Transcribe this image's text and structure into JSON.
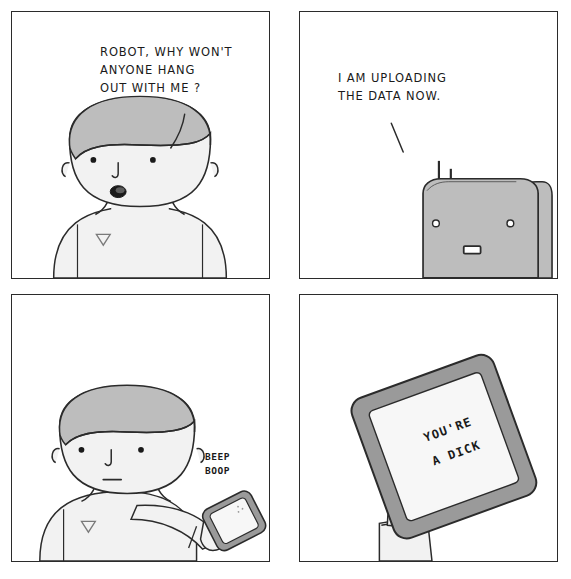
{
  "comic": {
    "title": "Robot Uploading The Data",
    "panel_count": 4,
    "colors": {
      "ink": "#2b2b2b",
      "skin_fill": "#f2f2f2",
      "hair_fill": "#bdbdbd",
      "robot_fill": "#bdbdbd",
      "tablet_bezel": "#9a9a9a",
      "tablet_screen": "#f7f7f7",
      "background": "#ffffff"
    },
    "panels": [
      {
        "id": "panel-1",
        "position": "top-left",
        "speaker": "man",
        "dialogue": "ROBOT, WHY WON'T\nANYONE HANG\nOUT WITH ME ?",
        "dialogue_lines": [
          "ROBOT, WHY WON'T",
          "ANYONE HANG",
          "OUT WITH ME ?"
        ],
        "scene": "man-talking-open-mouth",
        "characters": [
          "man"
        ],
        "expression": "open-mouth"
      },
      {
        "id": "panel-2",
        "position": "top-right",
        "speaker": "robot",
        "dialogue": "I AM UPLOADING\nTHE DATA NOW.",
        "dialogue_lines": [
          "I AM UPLOADING",
          "THE DATA NOW."
        ],
        "scene": "robot-head-with-antennae",
        "characters": [
          "robot"
        ],
        "expression": "blank-rectangular-mouth"
      },
      {
        "id": "panel-3",
        "position": "bottom-left",
        "speaker": "tablet",
        "dialogue": "BEEP\nBOOP",
        "dialogue_lines": [
          "BEEP",
          "BOOP"
        ],
        "scene": "man-holding-tablet",
        "characters": [
          "man",
          "tablet"
        ],
        "expression": "neutral-straight-mouth"
      },
      {
        "id": "panel-4",
        "position": "bottom-right",
        "speaker": "tablet-screen",
        "dialogue": "YOU'RE\nA DICK",
        "dialogue_lines": [
          "YOU'RE",
          "A DICK"
        ],
        "scene": "tablet-held-up-close",
        "characters": [
          "hand",
          "tablet"
        ],
        "expression": "none"
      }
    ],
    "icons": {
      "antenna": "antenna-icon",
      "tablet": "tablet-icon",
      "hand": "hand-icon"
    }
  }
}
